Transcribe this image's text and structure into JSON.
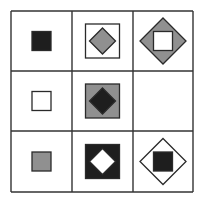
{
  "puzzle": {
    "type": "matrix-reasoning",
    "rows": 3,
    "cols": 3,
    "colors": {
      "background": "#ffffff",
      "grid_line": "#333333",
      "black": "#1e1e1e",
      "gray": "#909090",
      "white": "#ffffff",
      "stroke": "#2a2a2a"
    },
    "cells": [
      {
        "row": 0,
        "col": 0,
        "shapes": [
          {
            "kind": "square",
            "size": "small",
            "fill": "black"
          }
        ]
      },
      {
        "row": 0,
        "col": 1,
        "shapes": [
          {
            "kind": "square",
            "size": "medium",
            "fill": "white"
          },
          {
            "kind": "diamond",
            "size": "small",
            "fill": "gray"
          }
        ]
      },
      {
        "row": 0,
        "col": 2,
        "shapes": [
          {
            "kind": "diamond",
            "size": "large",
            "fill": "gray"
          },
          {
            "kind": "square",
            "size": "small",
            "fill": "white"
          }
        ]
      },
      {
        "row": 1,
        "col": 0,
        "shapes": [
          {
            "kind": "square",
            "size": "small",
            "fill": "white"
          }
        ]
      },
      {
        "row": 1,
        "col": 1,
        "shapes": [
          {
            "kind": "square",
            "size": "medium",
            "fill": "gray"
          },
          {
            "kind": "diamond",
            "size": "small",
            "fill": "black"
          }
        ]
      },
      {
        "row": 1,
        "col": 2,
        "shapes": [],
        "missing": true
      },
      {
        "row": 2,
        "col": 0,
        "shapes": [
          {
            "kind": "square",
            "size": "small",
            "fill": "gray"
          }
        ]
      },
      {
        "row": 2,
        "col": 1,
        "shapes": [
          {
            "kind": "square",
            "size": "medium",
            "fill": "black"
          },
          {
            "kind": "diamond",
            "size": "small",
            "fill": "white"
          }
        ]
      },
      {
        "row": 2,
        "col": 2,
        "shapes": [
          {
            "kind": "diamond",
            "size": "large",
            "fill": "white"
          },
          {
            "kind": "square",
            "size": "small",
            "fill": "black"
          }
        ]
      }
    ]
  }
}
